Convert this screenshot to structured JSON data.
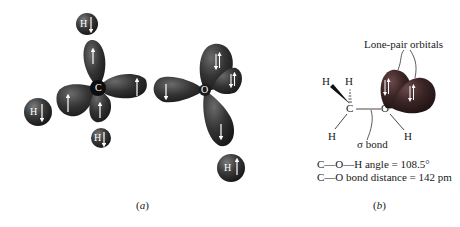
{
  "panel_a": {
    "caption": "a",
    "methane_carbon": {
      "center_label": "C",
      "hydrogens": [
        {
          "label": "H",
          "spin": "down",
          "position": "top"
        },
        {
          "label": "H",
          "spin": "down",
          "position": "left"
        },
        {
          "label": "H",
          "spin": "down",
          "position": "bottom"
        }
      ],
      "lobes": [
        {
          "position": "top",
          "spin": "up"
        },
        {
          "position": "right",
          "spin": "up"
        },
        {
          "position": "left",
          "spin": "up"
        },
        {
          "position": "bottom",
          "spin": "up"
        }
      ]
    },
    "oxygen": {
      "center_label": "O",
      "lobes": [
        {
          "position": "left",
          "spin": "down"
        },
        {
          "position": "upper-a",
          "spin": "paired"
        },
        {
          "position": "upper-b",
          "spin": "paired"
        },
        {
          "position": "bottom",
          "spin": "down"
        }
      ],
      "hydrogen": {
        "label": "H",
        "spin": "up"
      }
    }
  },
  "panel_b": {
    "caption": "b",
    "lone_pair_label": "Lone-pair orbitals",
    "sigma_bond_label": "σ bond",
    "atoms": {
      "c": "C",
      "o": "O",
      "h_wedge": "H",
      "h_hash": "H",
      "h_lower_left": "H",
      "h_on_o": "H"
    },
    "info_lines": [
      "C—O—H angle = 108.5°",
      "C—O bond distance = 142 pm"
    ]
  },
  "colors": {
    "orbital_dark": "#2a2a2a",
    "orbital_mid": "#4a4a4a",
    "lone_pair_dark": "#3a2020",
    "background": "#ffffff"
  }
}
